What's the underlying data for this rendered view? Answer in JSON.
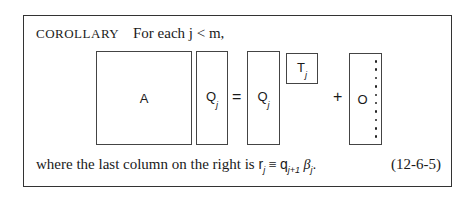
{
  "corollary": {
    "label": "COROLLARY",
    "statement": "For each j < m,"
  },
  "diagram": {
    "A": {
      "label": "A"
    },
    "Qj_left": {
      "label": "Q",
      "sub": "j"
    },
    "equals": "=",
    "Qj_right": {
      "label": "Q",
      "sub": "j"
    },
    "Tj": {
      "label": "T",
      "sub": "j"
    },
    "plus": "+",
    "O": {
      "label": "O",
      "dots": 10
    }
  },
  "footer": {
    "text": "where the last column on the right is",
    "r": "r",
    "r_sub": "j",
    "equiv": " ≡ ",
    "q": "q",
    "q_sub": "j+1",
    "beta": " β",
    "beta_sub": "j",
    "end": "."
  },
  "equation_number": "(12-6-5)"
}
